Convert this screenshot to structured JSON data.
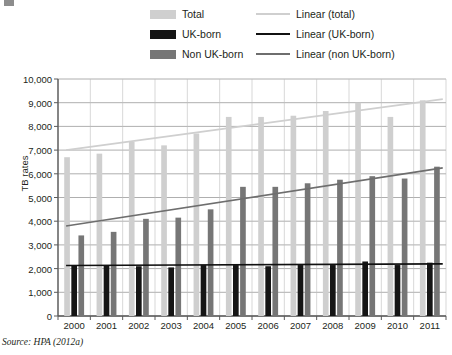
{
  "figure": {
    "source_note": "Source: HPA (2012a)"
  },
  "legend": {
    "column1": [
      {
        "key": "total",
        "label": "Total",
        "swatch": "total",
        "color": "#cfcfcf"
      },
      {
        "key": "uk",
        "label": "UK-born",
        "swatch": "uk",
        "color": "#151515"
      },
      {
        "key": "nonuk",
        "label": "Non UK-born",
        "swatch": "nonuk",
        "color": "#767676"
      }
    ],
    "column2": [
      {
        "key": "lin_total",
        "label": "Linear (total)",
        "color": "#cfcfcf"
      },
      {
        "key": "lin_uk",
        "label": "Linear (UK-born)",
        "color": "#111111"
      },
      {
        "key": "lin_nonuk",
        "label": "Linear (non UK-born)",
        "color": "#6e6e6e"
      }
    ]
  },
  "chart_data": {
    "type": "bar",
    "title": "",
    "xlabel": "",
    "ylabel": "TB rates",
    "ylim": [
      0,
      10000
    ],
    "ytick_values": [
      0,
      1000,
      2000,
      3000,
      4000,
      5000,
      6000,
      7000,
      8000,
      9000,
      10000
    ],
    "ytick_labels": [
      "0",
      "1,000",
      "2,000",
      "3,000",
      "4,000",
      "5,000",
      "6,000",
      "7,000",
      "8,000",
      "9,000",
      "10,000"
    ],
    "grid": true,
    "legend_position": "top",
    "categories": [
      "2000",
      "2001",
      "2002",
      "2003",
      "2004",
      "2005",
      "2006",
      "2007",
      "2008",
      "2009",
      "2010",
      "2011"
    ],
    "series": [
      {
        "name": "Total",
        "color": "#cfcfcf",
        "values": [
          6700,
          6850,
          7350,
          7200,
          7700,
          8400,
          8400,
          8450,
          8650,
          9000,
          8400,
          9100
        ]
      },
      {
        "name": "UK-born",
        "color": "#151515",
        "values": [
          2150,
          2150,
          2100,
          2050,
          2150,
          2150,
          2100,
          2150,
          2150,
          2300,
          2150,
          2250
        ]
      },
      {
        "name": "Non UK-born",
        "color": "#767676",
        "values": [
          3400,
          3550,
          4100,
          4150,
          4500,
          5450,
          5450,
          5600,
          5750,
          5900,
          5800,
          6300
        ]
      }
    ],
    "trendlines": [
      {
        "name": "Linear (total)",
        "color": "#cfcfcf",
        "start": 7000,
        "end": 9150
      },
      {
        "name": "Linear (UK-born)",
        "color": "#111111",
        "start": 2130,
        "end": 2200
      },
      {
        "name": "Linear (non UK-born)",
        "color": "#6e6e6e",
        "start": 3800,
        "end": 6250
      }
    ]
  }
}
